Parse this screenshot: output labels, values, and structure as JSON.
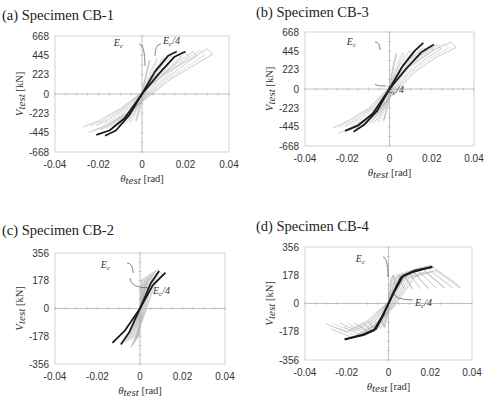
{
  "figure": {
    "panels": [
      {
        "id": "a",
        "title": "(a) Specimen CB-1"
      },
      {
        "id": "b",
        "title": "(b) Specimen CB-3"
      },
      {
        "id": "c",
        "title": "(c) Specimen CB-2"
      },
      {
        "id": "d",
        "title": "(d) Specimen CB-4"
      }
    ]
  },
  "chart_data": [
    {
      "type": "line",
      "title": "(a) Specimen CB-1",
      "xlabel": "θ_test [rad]",
      "ylabel": "V_test [kN]",
      "xlim": [
        -0.04,
        0.04
      ],
      "ylim": [
        -668,
        668
      ],
      "xticks": [
        -0.04,
        -0.02,
        0,
        0.02,
        0.04
      ],
      "yticks": [
        668,
        445,
        223,
        0,
        -223,
        -445,
        -668
      ],
      "grid": false,
      "annotations": [
        "E_c",
        "E_c/4"
      ],
      "series": [
        {
          "name": "Test hysteresis",
          "style": "gray thin loops",
          "x": [
            -0.027,
            -0.02,
            -0.01,
            0,
            0.01,
            0.02,
            0.03
          ],
          "y": [
            -400,
            -330,
            -190,
            0,
            200,
            350,
            500
          ]
        },
        {
          "name": "E_c model",
          "style": "black thick",
          "x": [
            -0.021,
            -0.015,
            -0.008,
            0,
            0.006,
            0.012,
            0.016
          ],
          "y": [
            -470,
            -420,
            -280,
            0,
            260,
            440,
            490
          ]
        },
        {
          "name": "E_c/4 model",
          "style": "black thick",
          "x": [
            -0.017,
            -0.012,
            -0.006,
            0,
            0.008,
            0.015,
            0.02
          ],
          "y": [
            -480,
            -420,
            -250,
            0,
            240,
            430,
            490
          ]
        }
      ]
    },
    {
      "type": "line",
      "title": "(b) Specimen CB-3",
      "xlabel": "θ_test [rad]",
      "ylabel": "V_test [kN]",
      "xlim": [
        -0.04,
        0.04
      ],
      "ylim": [
        -668,
        668
      ],
      "xticks": [
        -0.04,
        -0.02,
        0,
        0.02,
        0.04
      ],
      "yticks": [
        668,
        445,
        223,
        0,
        -223,
        -445,
        -668
      ],
      "grid": false,
      "annotations": [
        "E_c",
        "E_c/4"
      ],
      "series": [
        {
          "name": "Test hysteresis",
          "style": "gray thin loops",
          "x": [
            -0.027,
            -0.02,
            -0.01,
            0,
            0.01,
            0.02,
            0.029
          ],
          "y": [
            -480,
            -400,
            -250,
            0,
            250,
            420,
            530
          ]
        },
        {
          "name": "E_c model",
          "style": "black thick",
          "x": [
            -0.021,
            -0.015,
            -0.008,
            0,
            0.006,
            0.012,
            0.016
          ],
          "y": [
            -490,
            -430,
            -290,
            0,
            260,
            450,
            540
          ]
        },
        {
          "name": "E_c/4 model",
          "style": "black thick",
          "x": [
            -0.017,
            -0.012,
            -0.006,
            0,
            0.008,
            0.015,
            0.021
          ],
          "y": [
            -500,
            -420,
            -260,
            0,
            240,
            430,
            520
          ]
        }
      ]
    },
    {
      "type": "line",
      "title": "(c) Specimen CB-2",
      "xlabel": "θ_test [rad]",
      "ylabel": "V_test [kN]",
      "xlim": [
        -0.04,
        0.04
      ],
      "ylim": [
        -356,
        356
      ],
      "xticks": [
        -0.04,
        -0.02,
        0,
        0.02,
        0.04
      ],
      "yticks": [
        356,
        178,
        0,
        -178,
        -356
      ],
      "grid": false,
      "annotations": [
        "E_c",
        "E_c/4"
      ],
      "series": [
        {
          "name": "Test hysteresis",
          "style": "gray thin",
          "x": [
            -0.007,
            -0.004,
            0,
            0.004,
            0.008
          ],
          "y": [
            -230,
            -150,
            0,
            160,
            240
          ]
        },
        {
          "name": "E_c model",
          "style": "black thick",
          "x": [
            -0.009,
            -0.005,
            0,
            0.005,
            0.009
          ],
          "y": [
            -230,
            -150,
            0,
            160,
            240
          ]
        },
        {
          "name": "E_c/4 model",
          "style": "black thick",
          "x": [
            -0.013,
            -0.007,
            0,
            0.006,
            0.012
          ],
          "y": [
            -220,
            -140,
            0,
            150,
            230
          ]
        }
      ]
    },
    {
      "type": "line",
      "title": "(d) Specimen CB-4",
      "xlabel": "θ_test [rad]",
      "ylabel": "V_test [kN]",
      "xlim": [
        -0.04,
        0.04
      ],
      "ylim": [
        -356,
        356
      ],
      "xticks": [
        -0.04,
        -0.02,
        0,
        0.02,
        0.04
      ],
      "yticks": [
        356,
        178,
        0,
        -178,
        -356
      ],
      "grid": false,
      "annotations": [
        "E_c",
        "E_c/4"
      ],
      "series": [
        {
          "name": "Test hysteresis",
          "style": "gray thin loops",
          "x": [
            -0.03,
            -0.02,
            -0.01,
            0,
            0.01,
            0.02,
            0.032
          ],
          "y": [
            -140,
            -190,
            -120,
            0,
            190,
            230,
            120
          ]
        },
        {
          "name": "E_c model",
          "style": "black thick",
          "x": [
            -0.021,
            -0.012,
            -0.007,
            -0.003,
            0,
            0.003,
            0.007,
            0.012,
            0.021
          ],
          "y": [
            -225,
            -200,
            -170,
            -80,
            0,
            80,
            175,
            205,
            230
          ]
        },
        {
          "name": "E_c/4 model",
          "style": "black thick",
          "x": [
            -0.021,
            -0.012,
            -0.006,
            -0.002,
            0,
            0.002,
            0.006,
            0.012,
            0.021
          ],
          "y": [
            -228,
            -195,
            -160,
            -60,
            0,
            60,
            165,
            200,
            232
          ]
        }
      ]
    }
  ]
}
